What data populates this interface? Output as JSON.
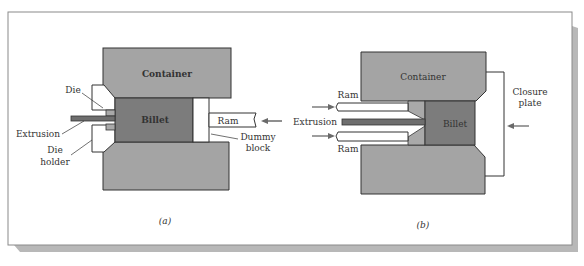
{
  "figure": {
    "panel_a": {
      "caption": "(a)",
      "labels": {
        "container": "Container",
        "billet": "Billet",
        "die": "Die",
        "extrusion": "Extrusion",
        "die_holder_1": "Die",
        "die_holder_2": "holder",
        "ram": "Ram",
        "dummy_1": "Dummy",
        "dummy_2": "block"
      }
    },
    "panel_b": {
      "caption": "(b)",
      "labels": {
        "container": "Container",
        "billet": "Billet",
        "ram_top": "Ram",
        "ram_bottom": "Ram",
        "extrusion": "Extrusion",
        "closure_1": "Closure",
        "closure_2": "plate"
      }
    }
  },
  "colors": {
    "container": "#a4a4a4",
    "billet": "#7c7c7c",
    "extrusion": "#6e6e6e",
    "die": "#a9a9a9",
    "arrow": "#6a6a6a",
    "shadow": "#b8b8b8",
    "frame": "#8a8a8a"
  }
}
